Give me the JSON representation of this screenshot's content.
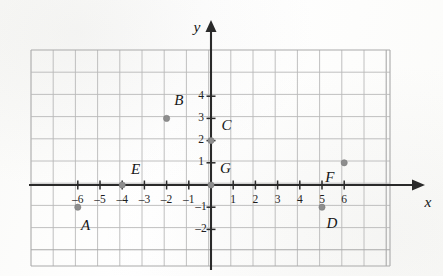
{
  "figure": {
    "kind": "coordinate-plane",
    "background_color": "#fdfdfc",
    "grid_color": "#b9b9b9",
    "axis_color": "#2a2a2a",
    "point_color": "#8d8d8d",
    "label_color": "#161616"
  },
  "axes": {
    "x_label": "x",
    "y_label": "y",
    "x_ticks": [
      {
        "value": -6,
        "label": "–6"
      },
      {
        "value": -5,
        "label": "–5"
      },
      {
        "value": -4,
        "label": "–4"
      },
      {
        "value": -3,
        "label": "–3"
      },
      {
        "value": -2,
        "label": "–2"
      },
      {
        "value": -1,
        "label": "–1"
      },
      {
        "value": 1,
        "label": "1"
      },
      {
        "value": 2,
        "label": "2"
      },
      {
        "value": 3,
        "label": "3"
      },
      {
        "value": 4,
        "label": "4"
      },
      {
        "value": 5,
        "label": "5"
      },
      {
        "value": 6,
        "label": "6"
      }
    ],
    "y_ticks": [
      {
        "value": 4,
        "label": "4"
      },
      {
        "value": 3,
        "label": "3"
      },
      {
        "value": 2,
        "label": "2"
      },
      {
        "value": 1,
        "label": "1"
      },
      {
        "value": -1,
        "label": "–1"
      },
      {
        "value": -2,
        "label": "–2"
      }
    ]
  },
  "chart_data": {
    "type": "scatter",
    "title": "",
    "xlabel": "x",
    "ylabel": "y",
    "xlim": [
      -7,
      9.1
    ],
    "ylim": [
      -3.7,
      6.1
    ],
    "grid": true,
    "legend": "none",
    "points": [
      {
        "name": "A",
        "x": -6,
        "y": -1,
        "label_dx": 0.35,
        "label_dy": -0.85
      },
      {
        "name": "B",
        "x": -2,
        "y": 3,
        "label_dx": 0.55,
        "label_dy": 0.75
      },
      {
        "name": "C",
        "x": 0,
        "y": 2,
        "label_dx": 0.7,
        "label_dy": 0.65
      },
      {
        "name": "D",
        "x": 5,
        "y": -1,
        "label_dx": 0.45,
        "label_dy": -0.8
      },
      {
        "name": "E",
        "x": -4,
        "y": 0,
        "label_dx": 0.6,
        "label_dy": 0.65
      },
      {
        "name": "F",
        "x": 6,
        "y": 1,
        "label_dx": -0.65,
        "label_dy": -0.7
      },
      {
        "name": "G",
        "x": 0,
        "y": 0,
        "label_dx": 0.65,
        "label_dy": 0.7
      }
    ]
  }
}
